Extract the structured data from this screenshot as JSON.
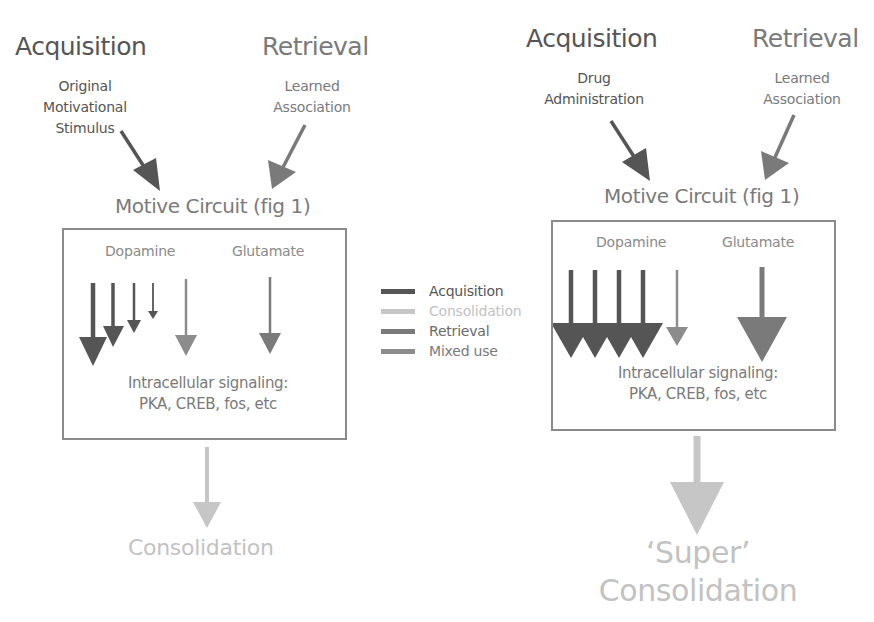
{
  "colors": {
    "acquisition": "#555555",
    "consolidation": "#c6c6c6",
    "retrieval": "#7a7a7a",
    "mixed_use": "#8c8c8c",
    "box_border": "#8a8a8a"
  },
  "left_panel": {
    "acquisition_title": "Acquisition",
    "acquisition_sub": [
      "Original",
      "Motivational",
      "Stimulus"
    ],
    "retrieval_title": "Retrieval",
    "retrieval_sub": [
      "Learned",
      "Association"
    ],
    "motive_circuit": "Motive Circuit (fig 1)",
    "box": {
      "dopamine_label": "Dopamine",
      "glutamate_label": "Glutamate",
      "signaling_line1": "Intracellular signaling:",
      "signaling_line2": "PKA, CREB, fos, etc"
    },
    "outcome": "Consolidation"
  },
  "right_panel": {
    "acquisition_title": "Acquisition",
    "acquisition_sub": [
      "Drug",
      "Administration"
    ],
    "retrieval_title": "Retrieval",
    "retrieval_sub": [
      "Learned",
      "Association"
    ],
    "motive_circuit": "Motive Circuit (fig 1)",
    "box": {
      "dopamine_label": "Dopamine",
      "glutamate_label": "Glutamate",
      "signaling_line1": "Intracellular signaling:",
      "signaling_line2": "PKA, CREB, fos, etc"
    },
    "outcome_line1": "‘Super’",
    "outcome_line2": "Consolidation"
  },
  "legend": {
    "items": [
      {
        "label": "Acquisition",
        "color_key": "acquisition"
      },
      {
        "label": "Consolidation",
        "color_key": "consolidation"
      },
      {
        "label": "Retrieval",
        "color_key": "retrieval"
      },
      {
        "label": "Mixed use",
        "color_key": "mixed_use"
      }
    ]
  }
}
